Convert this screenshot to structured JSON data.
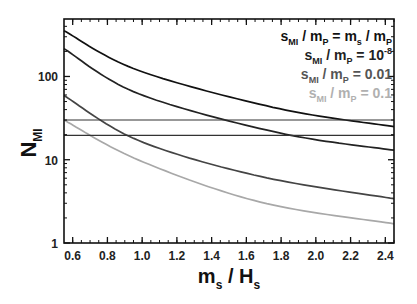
{
  "chart_data": {
    "type": "line",
    "title": "",
    "xlabel": "m_s / H_s",
    "xlabel_main": "m",
    "xlabel_sub1": "s",
    "xlabel_mid": " / H",
    "xlabel_sub2": "s",
    "ylabel": "N_MI",
    "ylabel_main": "N",
    "ylabel_sub": "MI",
    "yscale": "log",
    "xlim": [
      0.55,
      2.45
    ],
    "ylim": [
      1,
      490
    ],
    "grid": false,
    "legend_position": "upper right",
    "x_ticks": [
      "0.6",
      "0.8",
      "1.0",
      "1.2",
      "1.4",
      "1.6",
      "1.8",
      "2.0",
      "2.2",
      "2.4"
    ],
    "y_ticks": [
      "1",
      "10",
      "100"
    ],
    "x": [
      0.55,
      0.98,
      1.68,
      1.79,
      2.45
    ],
    "series": [
      {
        "name": "s_MI / m_P = m_s / m_P",
        "color": "#111111",
        "x": [
          0.55,
          0.98,
          1.79,
          2.45
        ],
        "values": [
          355,
          118,
          41,
          25
        ]
      },
      {
        "name": "s_MI / m_P = 10^-8",
        "color": "#222222",
        "x": [
          0.55,
          0.98,
          1.79,
          2.45
        ],
        "values": [
          216,
          62,
          21,
          13
        ]
      },
      {
        "name": "s_MI / m_P = 0.01",
        "color": "#444444",
        "x": [
          0.55,
          0.98,
          1.68,
          2.45
        ],
        "values": [
          59,
          17,
          6.3,
          3.4
        ]
      },
      {
        "name": "s_MI / m_P = 0.1",
        "color": "#a8a8a8",
        "x": [
          0.55,
          0.98,
          1.68,
          2.45
        ],
        "values": [
          30,
          9.9,
          3.1,
          1.7
        ]
      },
      {
        "name": "horizontal reference 1",
        "color": "#333333",
        "x": [
          0.55,
          2.45
        ],
        "values": [
          30,
          30
        ]
      },
      {
        "name": "horizontal reference 2",
        "color": "#333333",
        "x": [
          0.55,
          2.45
        ],
        "values": [
          19.6,
          19.6
        ]
      }
    ],
    "legend": [
      {
        "lhs": "s",
        "lhs_sub": "MI",
        "mid": " / m",
        "mid_sub": "P",
        "rhs": " = m",
        "rhs_sub": "s",
        "rhs2": " / m",
        "rhs2_sub": "P",
        "color": "#111111"
      },
      {
        "lhs": "s",
        "lhs_sub": "MI",
        "mid": " / m",
        "mid_sub": "P",
        "rhs": " = 10",
        "rhs_sup": "-8",
        "color": "#222222"
      },
      {
        "lhs": "s",
        "lhs_sub": "MI",
        "mid": " / m",
        "mid_sub": "P",
        "rhs": " = 0.01",
        "color": "#555555"
      },
      {
        "lhs": "s",
        "lhs_sub": "MI",
        "mid": " / m",
        "mid_sub": "P",
        "rhs": " = 0.1",
        "color": "#b0b0b0"
      }
    ]
  }
}
